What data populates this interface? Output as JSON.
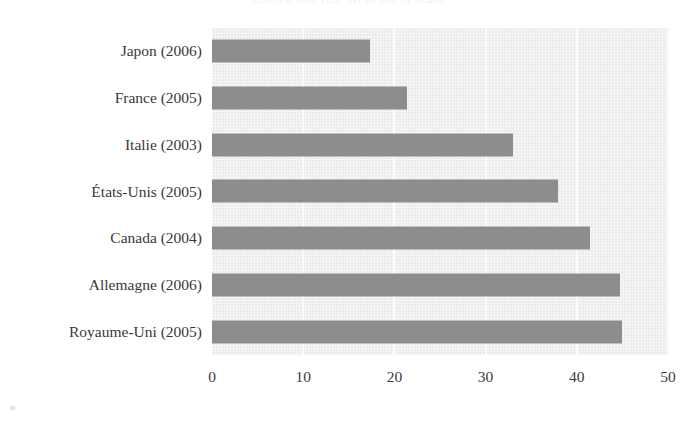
{
  "figure": {
    "background_color": "#ffffff",
    "plot_background_color": "#ebebeb",
    "bar_color": "#8d8d8d",
    "gridline_color": "#fbfbfb",
    "title_remnant": "clipped title (cut off at top of scan)"
  },
  "chart_data": {
    "type": "bar",
    "orientation": "horizontal",
    "title": "",
    "subtitle": "",
    "xlabel": "",
    "ylabel": "",
    "categories": [
      "Japon (2006)",
      "France (2005)",
      "Italie (2003)",
      "États-Unis (2005)",
      "Canada (2004)",
      "Allemagne (2006)",
      "Royaume-Uni (2005)"
    ],
    "values": [
      17.3,
      21.4,
      33.0,
      37.9,
      41.4,
      44.7,
      45.0
    ],
    "xlim": [
      0,
      50
    ],
    "xticks": [
      0,
      10,
      20,
      30,
      40,
      50
    ],
    "xtick_labels": [
      "0",
      "10",
      "20",
      "30",
      "40",
      "50"
    ],
    "grid": true,
    "grid_axis": "x",
    "legend": null,
    "legend_position": "none",
    "series": [
      {
        "name": "",
        "color": "#8d8d8d",
        "values": [
          17.3,
          21.4,
          33.0,
          37.9,
          41.4,
          44.7,
          45.0
        ]
      }
    ],
    "annotations": []
  }
}
